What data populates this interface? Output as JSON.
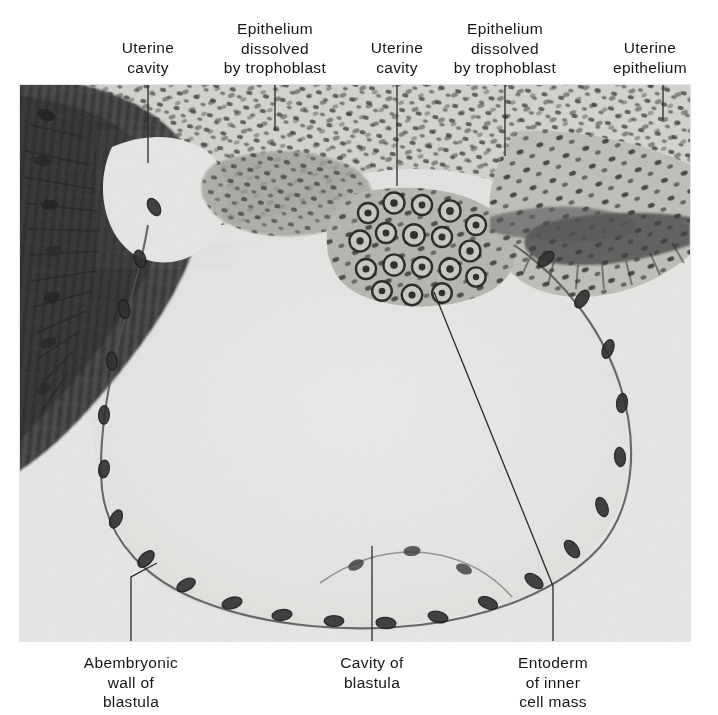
{
  "figure": {
    "kind": "histological-micrograph",
    "plate": {
      "x": 20,
      "y": 85,
      "width": 670,
      "height": 556,
      "background_color": "#e9e9e7",
      "stain_dark_color": "#2b2b2b",
      "cavity_color": "#ececeb"
    },
    "top_labels": [
      {
        "id": "uterine-cavity-left",
        "lines": [
          "Uterine",
          "cavity"
        ],
        "center_x": 148,
        "top_y": 38
      },
      {
        "id": "epithelium-dissolved-left",
        "lines": [
          "Epithelium",
          "dissolved",
          "by trophoblast"
        ],
        "center_x": 275,
        "top_y": 19
      },
      {
        "id": "uterine-cavity-right",
        "lines": [
          "Uterine",
          "cavity"
        ],
        "center_x": 397,
        "top_y": 38
      },
      {
        "id": "epithelium-dissolved-right",
        "lines": [
          "Epithelium",
          "dissolved",
          "by trophoblast"
        ],
        "center_x": 505,
        "top_y": 19
      },
      {
        "id": "uterine-epithelium",
        "lines": [
          "Uterine",
          "epithelium"
        ],
        "center_x": 650,
        "top_y": 38
      }
    ],
    "bottom_labels": [
      {
        "id": "abembryonic-wall",
        "lines": [
          "Abembryonic",
          "wall of",
          "blastula"
        ],
        "center_x": 131,
        "top_y": 653
      },
      {
        "id": "cavity-of-blastula",
        "lines": [
          "Cavity of",
          "blastula"
        ],
        "center_x": 372,
        "top_y": 653
      },
      {
        "id": "entoderm-inner-cell-mass",
        "lines": [
          "Entoderm",
          "of inner",
          "cell mass"
        ],
        "center_x": 553,
        "top_y": 653
      }
    ],
    "leader_lines": [
      {
        "id": "leader-uterine-cavity-left",
        "points": [
          [
            148,
            85
          ],
          [
            148,
            163
          ]
        ]
      },
      {
        "id": "leader-epithelium-dissolved-left",
        "points": [
          [
            275,
            85
          ],
          [
            275,
            131
          ]
        ]
      },
      {
        "id": "leader-uterine-cavity-right",
        "points": [
          [
            397,
            85
          ],
          [
            397,
            186
          ]
        ]
      },
      {
        "id": "leader-epithelium-dissolved-right",
        "points": [
          [
            505,
            85
          ],
          [
            505,
            156
          ]
        ]
      },
      {
        "id": "leader-uterine-epithelium",
        "points": [
          [
            663,
            85
          ],
          [
            663,
            119
          ]
        ]
      },
      {
        "id": "leader-abembryonic-wall",
        "points": [
          [
            157,
            563
          ],
          [
            131,
            577
          ],
          [
            131,
            641
          ]
        ]
      },
      {
        "id": "leader-cavity-of-blastula",
        "points": [
          [
            372,
            546
          ],
          [
            372,
            641
          ]
        ]
      },
      {
        "id": "leader-entoderm",
        "points": [
          [
            434,
            292
          ],
          [
            553,
            586
          ],
          [
            553,
            641
          ]
        ]
      }
    ],
    "leader_color": "#2a2a2a",
    "leader_width": 1.3
  }
}
